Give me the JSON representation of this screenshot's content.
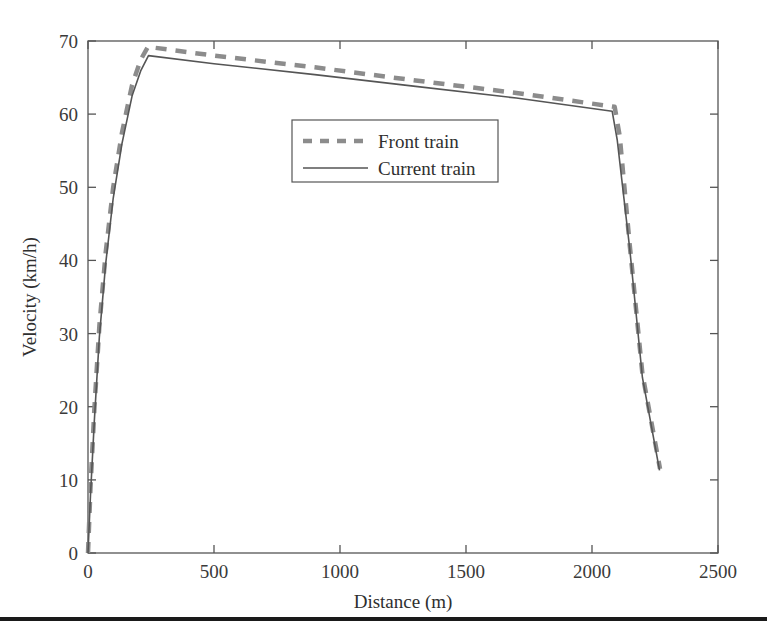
{
  "chart_data": {
    "type": "line",
    "title": "",
    "xlabel": "Distance (m)",
    "ylabel": "Velocity (km/h)",
    "xlim": [
      0,
      2500
    ],
    "ylim": [
      0,
      70
    ],
    "xticks": [
      0,
      500,
      1000,
      1500,
      2000,
      2500
    ],
    "yticks": [
      0,
      10,
      20,
      30,
      40,
      50,
      60,
      70
    ],
    "xtick_labels": [
      "0",
      "500",
      "1000",
      "1500",
      "2000",
      "2500"
    ],
    "ytick_labels": [
      "0",
      "10",
      "20",
      "30",
      "40",
      "50",
      "60",
      "70"
    ],
    "grid": false,
    "legend_position": "upper center",
    "series": [
      {
        "name": "Front train",
        "style": "dashed",
        "color": "#8c8c8c",
        "linewidth": 4.5,
        "x": [
          0,
          10,
          25,
          45,
          70,
          100,
          135,
          175,
          210,
          238,
          500,
          900,
          1300,
          1700,
          2090,
          2110,
          2150,
          2200,
          2270
        ],
        "y": [
          0,
          9.0,
          19.5,
          31.0,
          41.0,
          50.0,
          57.5,
          64.0,
          67.5,
          69.2,
          68.0,
          66.4,
          64.6,
          62.9,
          61.0,
          57.0,
          42.0,
          24.5,
          11.5
        ]
      },
      {
        "name": "Current train",
        "style": "solid",
        "color": "#555555",
        "linewidth": 1.6,
        "x": [
          0,
          10,
          25,
          45,
          70,
          100,
          135,
          175,
          210,
          240,
          500,
          900,
          1300,
          1700,
          2080,
          2100,
          2150,
          2200,
          2268
        ],
        "y": [
          0,
          8.0,
          18.0,
          29.5,
          39.5,
          48.5,
          56.0,
          62.5,
          66.0,
          68.0,
          66.9,
          65.4,
          63.8,
          62.2,
          60.4,
          56.5,
          41.5,
          24.0,
          11.3
        ]
      }
    ],
    "annotations": []
  },
  "legend": {
    "entries": [
      {
        "label": "Front train",
        "swatch": "dashed-line-swatch"
      },
      {
        "label": "Current train",
        "swatch": "solid-line-swatch"
      }
    ]
  },
  "axes": {
    "x_title": "Distance (m)",
    "y_title": "Velocity (km/h)"
  },
  "caption": {
    "text": ""
  },
  "colors": {
    "front_train": "#8c8c8c",
    "current_train": "#555555",
    "axis": "#555555",
    "text": "#2f2f2f",
    "rule": "#1a1a1a",
    "background": "#ffffff"
  }
}
